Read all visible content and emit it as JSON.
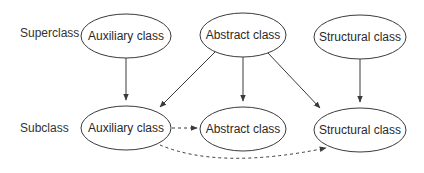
{
  "rows": {
    "superclass_label": "Superclass",
    "subclass_label": "Subclass"
  },
  "nodes": {
    "super_auxiliary": "Auxiliary class",
    "super_abstract": "Abstract class",
    "super_structural": "Structural class",
    "sub_auxiliary": "Auxiliary class",
    "sub_abstract": "Abstract class",
    "sub_structural": "Structural class"
  },
  "edges": [
    {
      "from": "super_auxiliary",
      "to": "sub_auxiliary",
      "style": "solid"
    },
    {
      "from": "super_abstract",
      "to": "sub_auxiliary",
      "style": "solid"
    },
    {
      "from": "super_abstract",
      "to": "sub_abstract",
      "style": "solid"
    },
    {
      "from": "super_abstract",
      "to": "sub_structural",
      "style": "solid"
    },
    {
      "from": "super_structural",
      "to": "sub_structural",
      "style": "solid"
    },
    {
      "from": "sub_auxiliary",
      "to": "sub_abstract",
      "style": "dashed"
    },
    {
      "from": "sub_auxiliary",
      "to": "sub_structural",
      "style": "dashed"
    }
  ],
  "colors": {
    "stroke": "#3a3a3a",
    "text": "#2a2a2a",
    "background": "#ffffff"
  }
}
